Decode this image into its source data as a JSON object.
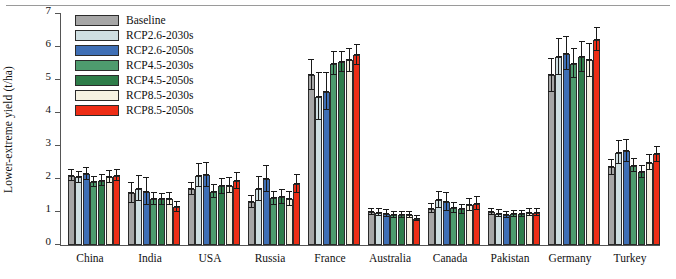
{
  "chart_data": {
    "type": "bar",
    "title": "",
    "xlabel": "",
    "ylabel": "Lower-extreme yield (t/ha)",
    "ylim": [
      0,
      7
    ],
    "yticks": [
      0,
      1,
      2,
      3,
      4,
      5,
      6,
      7
    ],
    "grid": false,
    "legend_position": "top-left",
    "categories": [
      "China",
      "India",
      "USA",
      "Russia",
      "France",
      "Australia",
      "Canada",
      "Pakistan",
      "Germany",
      "Turkey"
    ],
    "series": [
      {
        "name": "Baseline",
        "color": "#a6a6a6",
        "values": [
          2.1,
          1.58,
          1.7,
          1.3,
          5.15,
          1.0,
          1.1,
          1.0,
          5.15,
          2.35
        ],
        "errors": [
          0.16,
          0.3,
          0.18,
          0.18,
          0.45,
          0.1,
          0.14,
          0.1,
          0.5,
          0.22
        ]
      },
      {
        "name": "RCP2.6-2030s",
        "color": "#cfdfe2",
        "values": [
          2.05,
          1.7,
          2.1,
          1.7,
          4.5,
          0.98,
          1.36,
          0.95,
          5.7,
          2.8
        ],
        "errors": [
          0.17,
          0.38,
          0.34,
          0.36,
          0.7,
          0.1,
          0.24,
          0.1,
          0.55,
          0.34
        ]
      },
      {
        "name": "RCP2.6-2050s",
        "color": "#3f6fb5",
        "values": [
          2.15,
          1.62,
          2.12,
          2.0,
          4.65,
          0.95,
          1.3,
          0.92,
          5.8,
          2.85
        ],
        "errors": [
          0.18,
          0.4,
          0.36,
          0.4,
          0.55,
          0.1,
          0.28,
          0.09,
          0.5,
          0.32
        ]
      },
      {
        "name": "RCP4.5-2030s",
        "color": "#4e9b6e",
        "values": [
          1.9,
          1.4,
          1.62,
          1.42,
          5.5,
          0.92,
          1.12,
          0.95,
          5.5,
          2.4
        ],
        "errors": [
          0.15,
          0.18,
          0.2,
          0.2,
          0.35,
          0.09,
          0.16,
          0.09,
          0.45,
          0.2
        ]
      },
      {
        "name": "RCP4.5-2050s",
        "color": "#2e7d49",
        "values": [
          1.95,
          1.38,
          1.78,
          1.45,
          5.55,
          0.9,
          1.08,
          0.95,
          5.7,
          2.2
        ],
        "errors": [
          0.16,
          0.16,
          0.22,
          0.22,
          0.3,
          0.09,
          0.14,
          0.09,
          0.45,
          0.18
        ]
      },
      {
        "name": "RCP8.5-2030s",
        "color": "#f6f2e2",
        "values": [
          2.05,
          1.4,
          1.8,
          1.4,
          5.6,
          0.92,
          1.2,
          0.98,
          5.6,
          2.5
        ],
        "errors": [
          0.18,
          0.18,
          0.22,
          0.22,
          0.35,
          0.09,
          0.18,
          0.1,
          0.5,
          0.24
        ]
      },
      {
        "name": "RCP8.5-2050s",
        "color": "#ee2d16",
        "values": [
          2.1,
          1.15,
          1.95,
          1.85,
          5.75,
          0.8,
          1.25,
          0.98,
          6.22,
          2.75
        ],
        "errors": [
          0.16,
          0.16,
          0.24,
          0.26,
          0.3,
          0.08,
          0.2,
          0.1,
          0.35,
          0.22
        ]
      }
    ]
  }
}
